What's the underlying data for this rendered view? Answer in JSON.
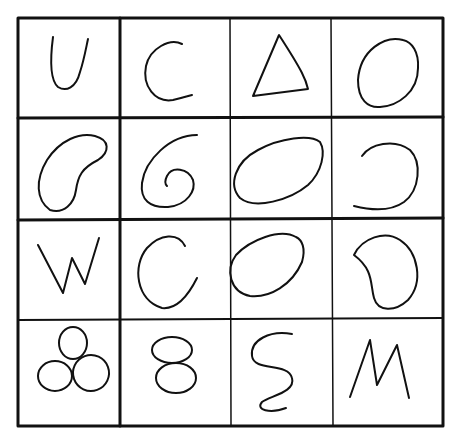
{
  "grid": {
    "rows": 4,
    "cols": 4,
    "cells": [
      {
        "row": 0,
        "col": 0,
        "shape": "letter-U"
      },
      {
        "row": 0,
        "col": 1,
        "shape": "letter-C"
      },
      {
        "row": 0,
        "col": 2,
        "shape": "triangle"
      },
      {
        "row": 0,
        "col": 3,
        "shape": "oval"
      },
      {
        "row": 1,
        "col": 0,
        "shape": "kidney-bean"
      },
      {
        "row": 1,
        "col": 1,
        "shape": "spiral-6"
      },
      {
        "row": 1,
        "col": 2,
        "shape": "tilted-ellipse"
      },
      {
        "row": 1,
        "col": 3,
        "shape": "open-arc"
      },
      {
        "row": 2,
        "col": 0,
        "shape": "letter-W"
      },
      {
        "row": 2,
        "col": 1,
        "shape": "letter-C"
      },
      {
        "row": 2,
        "col": 2,
        "shape": "oval"
      },
      {
        "row": 2,
        "col": 3,
        "shape": "bean"
      },
      {
        "row": 3,
        "col": 0,
        "shape": "three-circles"
      },
      {
        "row": 3,
        "col": 1,
        "shape": "figure-8"
      },
      {
        "row": 3,
        "col": 2,
        "shape": "epsilon-3"
      },
      {
        "row": 3,
        "col": 3,
        "shape": "letter-M"
      }
    ]
  },
  "colors": {
    "ink": "#111111",
    "paper": "#ffffff"
  }
}
